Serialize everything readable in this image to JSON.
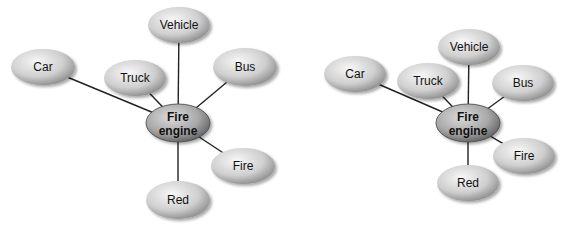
{
  "diagrams": [
    {
      "name": "mind-map-spread",
      "center": {
        "label_line1": "Fire",
        "label_line2": "engine",
        "cx": 178,
        "cy": 123,
        "rx": 32,
        "ry": 19
      },
      "nodes": [
        {
          "label": "Car",
          "cx": 43,
          "cy": 67,
          "rx": 32,
          "ry": 18
        },
        {
          "label": "Vehicle",
          "cx": 179,
          "cy": 25,
          "rx": 31,
          "ry": 18
        },
        {
          "label": "Truck",
          "cx": 135,
          "cy": 78,
          "rx": 31,
          "ry": 18
        },
        {
          "label": "Bus",
          "cx": 245,
          "cy": 67,
          "rx": 32,
          "ry": 19
        },
        {
          "label": "Fire",
          "cx": 243,
          "cy": 166,
          "rx": 32,
          "ry": 18
        },
        {
          "label": "Red",
          "cx": 178,
          "cy": 200,
          "rx": 32,
          "ry": 19
        }
      ]
    },
    {
      "name": "mind-map-compact",
      "center": {
        "label_line1": "Fire",
        "label_line2": "engine",
        "cx": 468,
        "cy": 123,
        "rx": 32,
        "ry": 19
      },
      "nodes": [
        {
          "label": "Car",
          "cx": 355,
          "cy": 74,
          "rx": 31,
          "ry": 18
        },
        {
          "label": "Vehicle",
          "cx": 469,
          "cy": 47,
          "rx": 31,
          "ry": 18
        },
        {
          "label": "Truck",
          "cx": 428,
          "cy": 81,
          "rx": 31,
          "ry": 18
        },
        {
          "label": "Bus",
          "cx": 523,
          "cy": 83,
          "rx": 31,
          "ry": 18
        },
        {
          "label": "Fire",
          "cx": 524,
          "cy": 156,
          "rx": 31,
          "ry": 18
        },
        {
          "label": "Red",
          "cx": 468,
          "cy": 183,
          "rx": 31,
          "ry": 18
        }
      ]
    }
  ],
  "colors": {
    "node_light": "#f4f4f4",
    "node_dark": "#8a8a8a",
    "center_light": "#d6d6d6",
    "center_dark": "#6e6e6e",
    "line": "#222222",
    "text": "#111111"
  }
}
